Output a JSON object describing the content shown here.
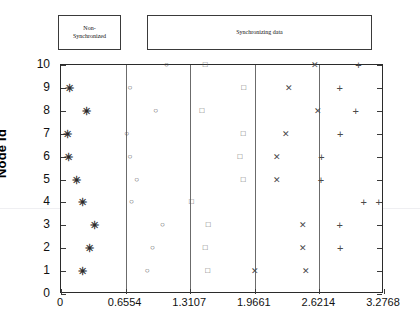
{
  "phases": [
    {
      "id": "non-synchronized",
      "label": "Non-\nSynchronized"
    },
    {
      "id": "synchronizing-data",
      "label": "Synchronizing data"
    }
  ],
  "chart_data": {
    "type": "scatter",
    "title": "",
    "xlabel": "",
    "ylabel": "Node Id",
    "xlim": [
      0,
      3.2768
    ],
    "ylim": [
      0,
      10
    ],
    "xticks": [
      0,
      0.6554,
      1.3107,
      1.9661,
      2.6214,
      3.2768
    ],
    "xtick_labels": [
      "0",
      "0.6554",
      "1.3107",
      "1.9661",
      "2.6214",
      "3.2768"
    ],
    "yticks": [
      0,
      1,
      2,
      3,
      4,
      5,
      6,
      7,
      8,
      9,
      10
    ],
    "ytick_labels": [
      "0",
      "1",
      "2",
      "3",
      "4",
      "5",
      "6",
      "7",
      "8",
      "9",
      "10"
    ],
    "grid": false,
    "legend": "none",
    "vertical_dividers": [
      0.6554,
      1.3107,
      1.9661,
      2.6214
    ],
    "series": [
      {
        "name": "Non-synchronized",
        "marker": "asterisk",
        "glyph": "✳",
        "color": "#2a2a2a",
        "points": [
          {
            "x": 0.088,
            "y": 9
          },
          {
            "x": 0.262,
            "y": 8
          },
          {
            "x": 0.061,
            "y": 7
          },
          {
            "x": 0.078,
            "y": 6
          },
          {
            "x": 0.159,
            "y": 5
          },
          {
            "x": 0.218,
            "y": 4
          },
          {
            "x": 0.34,
            "y": 3
          },
          {
            "x": 0.291,
            "y": 2
          },
          {
            "x": 0.218,
            "y": 1
          }
        ]
      },
      {
        "name": "Sync phase 1",
        "marker": "circle",
        "glyph": "○",
        "color": "#4a4a4a",
        "points": [
          {
            "x": 1.069,
            "y": 10
          },
          {
            "x": 0.699,
            "y": 9
          },
          {
            "x": 0.961,
            "y": 8
          },
          {
            "x": 0.665,
            "y": 7
          },
          {
            "x": 0.699,
            "y": 6
          },
          {
            "x": 0.767,
            "y": 5
          },
          {
            "x": 0.714,
            "y": 4
          },
          {
            "x": 1.03,
            "y": 3
          },
          {
            "x": 0.927,
            "y": 2
          },
          {
            "x": 0.873,
            "y": 1
          }
        ]
      },
      {
        "name": "Sync phase 2",
        "marker": "square",
        "glyph": "□",
        "color": "#5a5a5a",
        "points": [
          {
            "x": 1.463,
            "y": 10
          },
          {
            "x": 1.853,
            "y": 9
          },
          {
            "x": 1.429,
            "y": 8
          },
          {
            "x": 1.848,
            "y": 7
          },
          {
            "x": 1.814,
            "y": 6
          },
          {
            "x": 1.848,
            "y": 5
          },
          {
            "x": 1.322,
            "y": 4
          },
          {
            "x": 1.492,
            "y": 3
          },
          {
            "x": 1.463,
            "y": 2
          },
          {
            "x": 1.487,
            "y": 1
          }
        ]
      },
      {
        "name": "Sync phase 3",
        "marker": "x",
        "glyph": "✕",
        "color": "#4a4a4a",
        "points": [
          {
            "x": 2.58,
            "y": 10
          },
          {
            "x": 2.316,
            "y": 9
          },
          {
            "x": 2.604,
            "y": 8
          },
          {
            "x": 2.287,
            "y": 7
          },
          {
            "x": 2.19,
            "y": 6
          },
          {
            "x": 2.195,
            "y": 5
          },
          {
            "x": 2.453,
            "y": 3
          },
          {
            "x": 2.458,
            "y": 2
          },
          {
            "x": 1.965,
            "y": 1
          },
          {
            "x": 2.487,
            "y": 1
          }
        ]
      },
      {
        "name": "Sync phase 4",
        "marker": "plus",
        "glyph": "+",
        "color": "#4a4a4a",
        "points": [
          {
            "x": 3.018,
            "y": 10
          },
          {
            "x": 2.828,
            "y": 9
          },
          {
            "x": 2.989,
            "y": 8
          },
          {
            "x": 2.833,
            "y": 7
          },
          {
            "x": 2.643,
            "y": 6
          },
          {
            "x": 2.638,
            "y": 5
          },
          {
            "x": 3.071,
            "y": 4
          },
          {
            "x": 3.223,
            "y": 4
          },
          {
            "x": 2.828,
            "y": 3
          },
          {
            "x": 2.833,
            "y": 2
          }
        ]
      }
    ]
  }
}
